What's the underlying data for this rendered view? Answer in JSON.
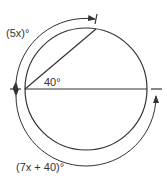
{
  "labels": {
    "arc_top": "(5x)°",
    "angle": "40°",
    "arc_bottom": "(7x + 40)°"
  },
  "colors": {
    "stroke": "#333333",
    "background": "#ffffff"
  }
}
